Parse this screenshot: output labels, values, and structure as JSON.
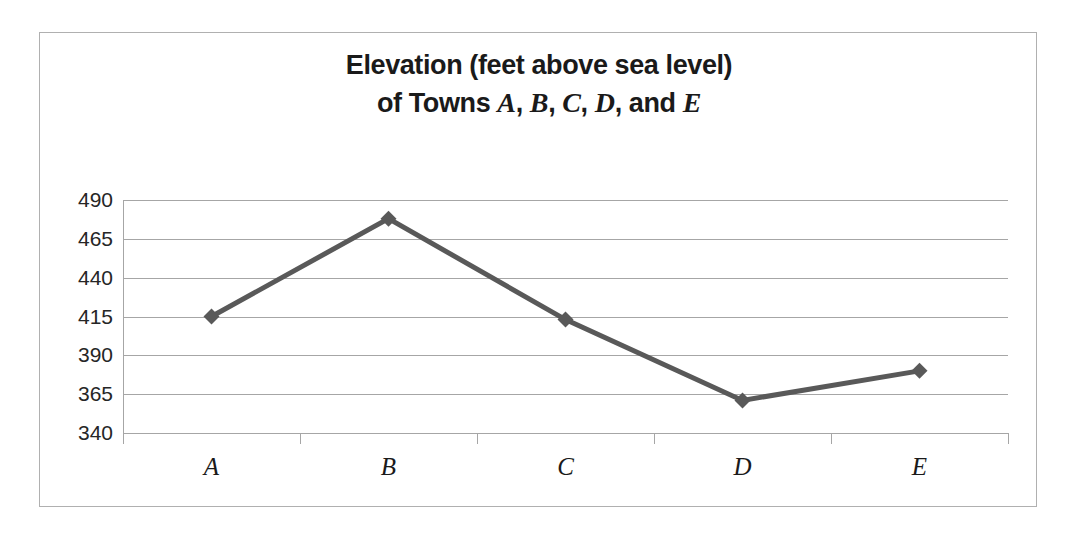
{
  "chart_data": {
    "type": "line",
    "title": "Elevation (feet above sea level) of Towns A, B, C, D, and E",
    "title_line1": "Elevation (feet above sea level)",
    "title_line2_prefix": "of Towns ",
    "title_line2_suffix": "and ",
    "categories": [
      "A",
      "B",
      "C",
      "D",
      "E"
    ],
    "values": [
      415,
      478,
      413,
      361,
      380
    ],
    "xlabel": "",
    "ylabel": "",
    "ylim": [
      340,
      490
    ],
    "ytick_step": 25,
    "yticks": [
      490,
      465,
      440,
      415,
      390,
      365,
      340
    ],
    "ytick_labels": [
      "490",
      "465",
      "440",
      "415",
      "390",
      "365",
      "340"
    ],
    "grid": "horizontal",
    "legend": "none",
    "series": [
      {
        "name": "Elevation",
        "values": [
          415,
          478,
          413,
          361,
          380
        ],
        "color": "#595959",
        "marker": "diamond",
        "line_width": 5
      }
    ],
    "colors": {
      "line": "#595959",
      "marker": "#595959",
      "gridline": "#a6a6a6",
      "axis": "#a6a6a6",
      "border": "#b0b0b0",
      "text": "#1a1a1a",
      "background": "#ffffff"
    }
  }
}
